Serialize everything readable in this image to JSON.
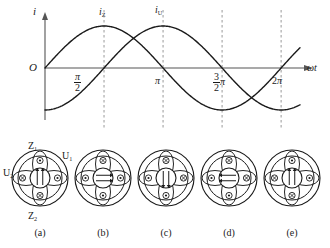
{
  "figure": {
    "background": "#ffffff",
    "ink": "#1a1a1a",
    "dash_color": "#8c8c8c",
    "axis_color": "#555555"
  },
  "chart_data": {
    "type": "line",
    "title": "",
    "xlabel": "ωt",
    "ylabel": "i",
    "origin_label": "O",
    "grid": false,
    "dashed_gridlines": true,
    "xlim": [
      0,
      6.7858
    ],
    "ylim": [
      -1.25,
      1.25
    ],
    "x_tick_values": [
      1.5708,
      3.1416,
      4.7124,
      6.2832
    ],
    "x_tick_labels": [
      "π/2",
      "π",
      "3/2 π",
      "2π"
    ],
    "x_tick_label_parts": [
      {
        "num": "π",
        "den": "2",
        "suffix": ""
      },
      {
        "plain": "π"
      },
      {
        "num": "3",
        "den": "2",
        "suffix": "π"
      },
      {
        "plain": "2π"
      }
    ],
    "legend_position": "inline-at-peaks",
    "series": [
      {
        "name": "i_Z",
        "label_base": "i",
        "label_sub": "Z",
        "form": "sine",
        "amplitude": 1,
        "phase_deg": 0,
        "peak_at": 1.5708,
        "peak_label_x": 1.5708,
        "color": "#1a1a1a"
      },
      {
        "name": "i_U",
        "label_base": "i",
        "label_sub": "U",
        "form": "sine",
        "amplitude": 1,
        "phase_deg": -90,
        "peak_at": 3.1416,
        "peak_label_x": 3.1416,
        "color": "#1a1a1a"
      }
    ]
  },
  "machines": {
    "winding_labels": {
      "top": {
        "base": "Z",
        "sub": "1"
      },
      "bottom": {
        "base": "Z",
        "sub": "2"
      },
      "left": {
        "base": "U",
        "sub": "2"
      },
      "right": {
        "base": "U",
        "sub": "1"
      }
    },
    "items": [
      {
        "caption": "(a)",
        "field_dir": "up",
        "field_arrows": 2,
        "poles": [
          "dot-top",
          "cross-left",
          "cross-right",
          "dot-bottom"
        ]
      },
      {
        "caption": "(b)",
        "field_dir": "right",
        "field_arrows": 2,
        "poles": [
          "cross-top",
          "dot-left",
          "dot-right",
          "dot-bottom"
        ]
      },
      {
        "caption": "(c)",
        "field_dir": "down",
        "field_arrows": 2,
        "poles": [
          "cross-top",
          "dot-left",
          "dot-right",
          "cross-bottom"
        ]
      },
      {
        "caption": "(d)",
        "field_dir": "left",
        "field_arrows": 2,
        "poles": [
          "cross-top",
          "dot-left",
          "dot-right",
          "cross-bottom"
        ]
      },
      {
        "caption": "(e)",
        "field_dir": "up",
        "field_arrows": 2,
        "poles": [
          "dot-top",
          "cross-left",
          "cross-right",
          "dot-bottom"
        ]
      }
    ]
  }
}
